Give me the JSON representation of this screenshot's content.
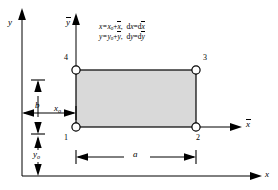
{
  "figure": {
    "type": "engineering-diagram",
    "background": "#ffffff",
    "element_fill": "#d9d9d9",
    "line_color": "#000000",
    "node_fill": "#ffffff"
  },
  "axes": {
    "global_y_label": "y",
    "global_x_label": "x",
    "local_y_label": "y",
    "local_x_label": "x",
    "local_overbar": true
  },
  "equations": {
    "line1_left": "x=x",
    "line1_left_sub": "o",
    "line1_left_plus": "+",
    "line1_left_bar": "x",
    "line1_right_d": "d",
    "line1_right_var": "x",
    "line1_right_eq": "=d",
    "line1_right_bar": "x",
    "line1_full": "x=xₒ+x̄,  dx=dx̄",
    "line2_full": "y=yₒ+ȳ,  dy=dȳ",
    "line2_left": "y=y",
    "line2_left_sub": "o",
    "line2_left_plus": "+",
    "line2_left_bar": "y",
    "line2_right_d": "d",
    "line2_right_var": "y",
    "line2_right_eq": "=d",
    "line2_right_bar": "y"
  },
  "nodes": [
    {
      "id": "1",
      "label": "1",
      "position": "bottom-left"
    },
    {
      "id": "2",
      "label": "2",
      "position": "bottom-right"
    },
    {
      "id": "3",
      "label": "3",
      "position": "top-right"
    },
    {
      "id": "4",
      "label": "4",
      "position": "top-left"
    }
  ],
  "dimensions": {
    "width_label": "a",
    "height_label": "b",
    "offset_x_label": "x",
    "offset_x_sub": "o",
    "offset_y_label": "y",
    "offset_y_sub": "o"
  }
}
